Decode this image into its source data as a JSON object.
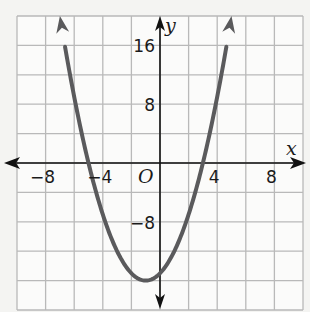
{
  "chart_data": {
    "type": "line",
    "title": "",
    "xlabel": "x",
    "ylabel": "y",
    "origin_label": "O",
    "xlim": [
      -10,
      10
    ],
    "ylim": [
      -20,
      20
    ],
    "x_grid_step": 2,
    "y_grid_step": 4,
    "grid": true,
    "x_ticks": [
      {
        "value": -8,
        "label": "−8"
      },
      {
        "value": -4,
        "label": "−4"
      },
      {
        "value": 4,
        "label": "4"
      },
      {
        "value": 8,
        "label": "8"
      }
    ],
    "y_ticks": [
      {
        "value": 16,
        "label": "16"
      },
      {
        "value": 8,
        "label": "8"
      },
      {
        "value": -8,
        "label": "−8"
      }
    ],
    "series": [
      {
        "name": "parabola",
        "function": "y = x^2 + 2x - 15",
        "coefficients": {
          "a": 1,
          "b": 2,
          "c": -15
        },
        "x_range": [
          -7,
          5
        ],
        "roots": [
          -5,
          3
        ],
        "vertex": [
          -1,
          -16
        ],
        "arrows_at_ends": true
      }
    ],
    "colors": {
      "curve": "#5a5a5c",
      "axes": "#111111",
      "grid": "#b9b9b9"
    }
  }
}
